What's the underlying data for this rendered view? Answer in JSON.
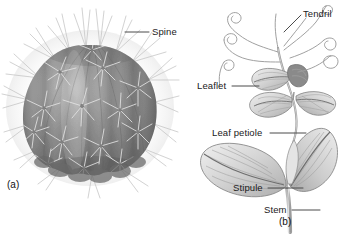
{
  "figure": {
    "background_color": "#ffffff",
    "width": 345,
    "height": 234
  },
  "panels": [
    {
      "id": "a",
      "caption": "(a)",
      "subject": "barrel cactus",
      "style": "grayscale shaded photograph-like rendering",
      "labels": [
        {
          "name": "spine",
          "text": "Spine",
          "leader": {
            "x1": 125,
            "y1": 32,
            "x2": 149,
            "y2": 32
          }
        }
      ]
    },
    {
      "id": "b",
      "caption": "(b)",
      "subject": "pea plant compound leaf",
      "style": "grayscale pencil line drawing with shading",
      "labels": [
        {
          "name": "tendril",
          "text": "Tendril",
          "leader": {
            "x1": 284,
            "y1": 32,
            "x2": 301,
            "y2": 15
          }
        },
        {
          "name": "leaflet",
          "text": "Leaflet",
          "leader": {
            "x1": 232,
            "y1": 86,
            "x2": 259,
            "y2": 86
          }
        },
        {
          "name": "leaf-petiole",
          "text": "Leaf petiole",
          "leader": {
            "x1": 270,
            "y1": 133,
            "x2": 306,
            "y2": 133
          }
        },
        {
          "name": "stipule",
          "text": "Stipule",
          "leader": {
            "x1": 268,
            "y1": 188,
            "x2": 303,
            "y2": 188
          }
        },
        {
          "name": "stem",
          "text": "Stem",
          "leader": {
            "x1": 292,
            "y1": 210,
            "x2": 320,
            "y2": 210
          }
        }
      ]
    }
  ],
  "colors": {
    "text": "#1a1a1a",
    "leader_line": "#4a4a4a",
    "cactus_body_dark": "#6e6e6e",
    "cactus_body_mid": "#8d8d8d",
    "cactus_body_light": "#b5b5b5",
    "spine": "#cfcfcf",
    "plant_line": "#8a8a8a",
    "leaf_fill": "#d8d8d8"
  }
}
